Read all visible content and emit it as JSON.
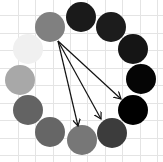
{
  "canvas": {
    "width": 163,
    "height": 162,
    "background": "#ffffff"
  },
  "grid": {
    "color": "#e4e4e4",
    "vertical_lines": [
      18,
      35,
      53,
      70,
      87,
      105,
      122,
      140,
      157
    ],
    "horizontal_lines": [
      15,
      33,
      50,
      68,
      85,
      103,
      120,
      138,
      155
    ]
  },
  "circles": [
    {
      "id": "c1",
      "cx": 50,
      "cy": 27,
      "r": 15,
      "fill": "#808080"
    },
    {
      "id": "c2",
      "cx": 81,
      "cy": 17,
      "r": 15,
      "fill": "#1a1a1a"
    },
    {
      "id": "c3",
      "cx": 111,
      "cy": 27,
      "r": 15,
      "fill": "#1c1c1c"
    },
    {
      "id": "c4",
      "cx": 133,
      "cy": 49,
      "r": 15,
      "fill": "#151515"
    },
    {
      "id": "c5",
      "cx": 141,
      "cy": 79,
      "r": 15,
      "fill": "#050505"
    },
    {
      "id": "c6",
      "cx": 133,
      "cy": 110,
      "r": 15,
      "fill": "#000000"
    },
    {
      "id": "c7",
      "cx": 112,
      "cy": 133,
      "r": 15,
      "fill": "#3c3c3c"
    },
    {
      "id": "c8",
      "cx": 82,
      "cy": 140,
      "r": 15,
      "fill": "#777777"
    },
    {
      "id": "c9",
      "cx": 50,
      "cy": 132,
      "r": 15,
      "fill": "#666666"
    },
    {
      "id": "c10",
      "cx": 28,
      "cy": 110,
      "r": 15,
      "fill": "#636363"
    },
    {
      "id": "c11",
      "cx": 20,
      "cy": 80,
      "r": 15,
      "fill": "#a8a8a8"
    },
    {
      "id": "c12",
      "cx": 28,
      "cy": 49,
      "r": 15,
      "fill": "#f0f0f0"
    }
  ],
  "arrows": [
    {
      "from": "c1",
      "to": "c8",
      "x1": 58,
      "y1": 41,
      "x2": 78,
      "y2": 126
    },
    {
      "from": "c1",
      "to": "c7",
      "x1": 58,
      "y1": 41,
      "x2": 101,
      "y2": 119
    },
    {
      "from": "c1",
      "to": "c6",
      "x1": 58,
      "y1": 41,
      "x2": 121,
      "y2": 99
    }
  ],
  "arrow_style": {
    "color": "#111111",
    "width": 1.2
  }
}
